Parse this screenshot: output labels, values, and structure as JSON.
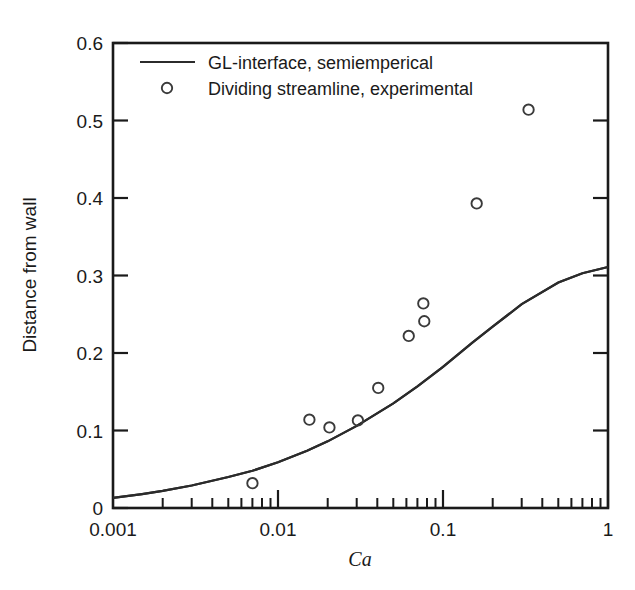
{
  "chart_data": {
    "type": "scatter",
    "title": "",
    "xlabel": "Ca",
    "ylabel": "Distance from wall",
    "xscale": "log",
    "yscale": "linear",
    "xlim": [
      0.001,
      1
    ],
    "ylim": [
      0,
      0.6
    ],
    "grid": false,
    "legend_position": "top-left-inside",
    "x_tick_labels": [
      "0.001",
      "0.01",
      "0.1",
      "1"
    ],
    "x_tick_values": [
      0.001,
      0.01,
      0.1,
      1
    ],
    "y_tick_labels": [
      "0",
      "0.1",
      "0.2",
      "0.3",
      "0.4",
      "0.5",
      "0.6"
    ],
    "y_tick_values": [
      0,
      0.1,
      0.2,
      0.3,
      0.4,
      0.5,
      0.6
    ],
    "series": [
      {
        "name": "GL-interface, semiemperical",
        "type": "line",
        "marker": "none",
        "color": "#2b2b2b",
        "x": [
          0.001,
          0.0015,
          0.002,
          0.003,
          0.005,
          0.007,
          0.01,
          0.015,
          0.02,
          0.03,
          0.05,
          0.07,
          0.1,
          0.15,
          0.2,
          0.3,
          0.5,
          0.7,
          1.0
        ],
        "y": [
          0.013,
          0.018,
          0.022,
          0.029,
          0.04,
          0.048,
          0.059,
          0.074,
          0.086,
          0.106,
          0.135,
          0.157,
          0.182,
          0.213,
          0.234,
          0.263,
          0.291,
          0.303,
          0.311
        ]
      },
      {
        "name": "Dividing streamline, experimental",
        "type": "scatter",
        "marker": "open-circle",
        "color": "#3a3a3a",
        "x": [
          0.007,
          0.0155,
          0.0205,
          0.0305,
          0.0405,
          0.062,
          0.076,
          0.077,
          0.16,
          0.33
        ],
        "y": [
          0.032,
          0.114,
          0.104,
          0.113,
          0.155,
          0.222,
          0.264,
          0.241,
          0.393,
          0.514
        ]
      }
    ],
    "legend_entries": [
      {
        "label": "GL-interface, semiemperical",
        "style": "line"
      },
      {
        "label": "Dividing streamline, experimental",
        "style": "open-circle"
      }
    ]
  },
  "axes": {
    "y_title": "Distance from wall",
    "x_title": "Ca",
    "y_ticks": [
      "0.6",
      "0.5",
      "0.4",
      "0.3",
      "0.2",
      "0.1",
      "0"
    ],
    "x_ticks": [
      "0.001",
      "0.01",
      "0.1",
      "1"
    ]
  },
  "legend": {
    "line_entry": "GL-interface, semiemperical",
    "marker_entry": "Dividing streamline, experimental"
  }
}
